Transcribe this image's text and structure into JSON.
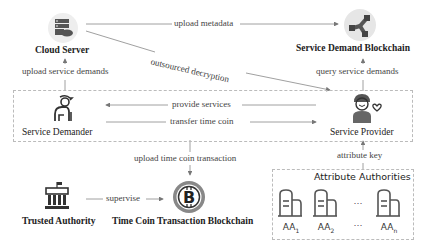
{
  "nodes": {
    "cloud_server": {
      "label": "Cloud Server",
      "icon": "cloud-server-icon"
    },
    "service_demand_blockchain": {
      "label": "Service Demand Blockchain",
      "icon": "blockchain-network-icon"
    },
    "service_demander": {
      "label": "Service Demander",
      "icon": "elderly-person-icon"
    },
    "service_provider": {
      "label": "Service Provider",
      "icon": "volunteer-person-heart-icon"
    },
    "trusted_authority": {
      "label": "Trusted Authority",
      "icon": "government-building-icon"
    },
    "time_coin_blockchain": {
      "label": "Time Coin Transaction  Blockchain",
      "icon": "bitcoin-coin-icon"
    },
    "attribute_authorities": {
      "label": "Attribute Authorities",
      "icon": "server-icon",
      "items": [
        {
          "name": "AA",
          "sub": "1"
        },
        {
          "name": "AA",
          "sub": "2"
        },
        {
          "name": "…",
          "sub": ""
        },
        {
          "name": "AA",
          "sub": "n"
        }
      ]
    }
  },
  "edges": {
    "upload_metadata": "upload metadata",
    "outsourced_decryption": "outsourced decryption",
    "upload_service_demands": "upload service demands",
    "query_service_demands": "query service demands",
    "provide_services": "provide services",
    "transfer_time_coin": "transfer time coin",
    "upload_time_coin_transaction": "upload time coin transaction",
    "supervise": "supervise",
    "attribute_key": "attribute key"
  },
  "colors": {
    "icon_dark": "#4a4a4a",
    "icon_circle_bg": "#e6e6e6",
    "line": "#888888",
    "dashed_border": "#bbbbbb"
  }
}
